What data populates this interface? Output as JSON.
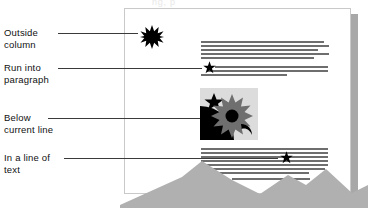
{
  "figure": {
    "title_cropped": "ng, p",
    "background_color": "#ffffff",
    "line_color": "#3a3a3a",
    "text_color": "#111111",
    "page_fill": "#ffffff",
    "page_border": "#c9c9c9",
    "shadow_color": "#a8a8a8",
    "body_text_line_color": "#6e6e6e",
    "art_box_fill": "#dcdcdc",
    "mountain_fill": "#b0b0b0"
  },
  "callouts": [
    {
      "id": "outside-column",
      "label": "Outside\ncolumn",
      "label_x": 4,
      "label_y": 27,
      "leader_x": 58,
      "leader_y": 33,
      "leader_width": 80,
      "target": "burst-outside-column"
    },
    {
      "id": "run-into-paragraph",
      "label": "Run into\nparagraph",
      "label_x": 4,
      "label_y": 62,
      "leader_x": 58,
      "leader_y": 68,
      "leader_width": 144,
      "target": "star-run-into-paragraph"
    },
    {
      "id": "below-current-line",
      "label": "Below\ncurrent line",
      "label_x": 4,
      "label_y": 112,
      "leader_x": 48,
      "leader_y": 118,
      "leader_width": 154,
      "target": "art-box-below-current-line"
    },
    {
      "id": "in-a-line-of-text",
      "label": "In a line of\ntext",
      "label_x": 4,
      "label_y": 152,
      "leader_x": 64,
      "leader_y": 158,
      "leader_width": 214,
      "target": "star-in-a-line-of-text"
    }
  ],
  "page": {
    "x": 124,
    "y": 8,
    "width": 227,
    "height": 186,
    "paragraph_top": {
      "lines": [
        {
          "x": 201,
          "y": 41,
          "width": 123
        },
        {
          "x": 201,
          "y": 45,
          "width": 128
        },
        {
          "x": 201,
          "y": 49,
          "width": 117
        },
        {
          "x": 201,
          "y": 53,
          "width": 128
        },
        {
          "x": 201,
          "y": 57,
          "width": 113
        },
        {
          "x": 215,
          "y": 66,
          "width": 113
        },
        {
          "x": 207,
          "y": 70,
          "width": 121
        },
        {
          "x": 201,
          "y": 74,
          "width": 86
        }
      ]
    },
    "paragraph_bottom": {
      "lines": [
        {
          "x": 201,
          "y": 148,
          "width": 127
        },
        {
          "x": 201,
          "y": 152,
          "width": 127
        },
        {
          "x": 201,
          "y": 156,
          "width": 127
        },
        {
          "x": 201,
          "y": 160,
          "width": 127
        },
        {
          "x": 201,
          "y": 164,
          "width": 127
        },
        {
          "x": 201,
          "y": 168,
          "width": 124
        },
        {
          "x": 201,
          "y": 172,
          "width": 108
        },
        {
          "x": 232,
          "y": 178,
          "width": 78
        }
      ]
    },
    "graphics": {
      "burst_outside_column": {
        "x": 140,
        "y": 25,
        "size": 24,
        "points": 12,
        "fill": "#000000"
      },
      "star_run_into_paragraph": {
        "x": 203,
        "y": 61,
        "size": 13,
        "points": 5,
        "fill": "#000000"
      },
      "star_in_a_line_of_text": {
        "x": 280,
        "y": 151,
        "size": 13,
        "points": 5,
        "fill": "#000000"
      },
      "art_box": {
        "x": 200,
        "y": 88,
        "width": 58,
        "height": 52,
        "star": {
          "fill": "#000000"
        },
        "sun": {
          "fill": "#7a7a7a",
          "core": "#000000"
        },
        "quarter_disc": {
          "fill": "#000000"
        },
        "swoosh": {
          "fill": "#000000"
        }
      }
    }
  }
}
